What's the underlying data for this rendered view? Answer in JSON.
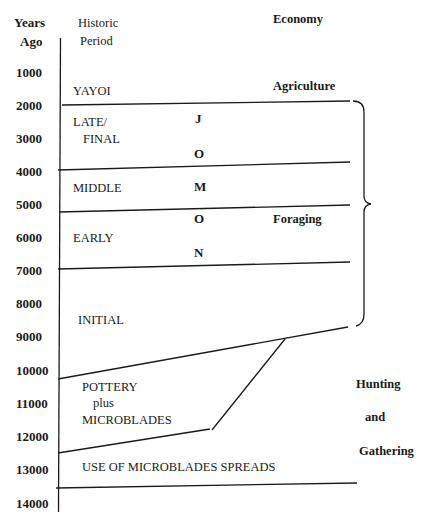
{
  "headers": {
    "years_ago_line1": "Years",
    "years_ago_line2": "Ago",
    "historic_line1": "Historic",
    "historic_line2": "Period",
    "economy": "Economy"
  },
  "axis": {
    "ticks": [
      "1000",
      "2000",
      "3000",
      "4000",
      "5000",
      "6000",
      "7000",
      "8000",
      "9000",
      "10000",
      "11000",
      "12000",
      "13000",
      "14000"
    ]
  },
  "periods": {
    "yayoi": "YAYOI",
    "late_line1": "LATE/",
    "late_line2": "FINAL",
    "middle": "MIDDLE",
    "early": "EARLY",
    "initial": "INITIAL",
    "pottery_line1": "POTTERY",
    "pottery_line2": "plus",
    "pottery_line3": "MICROBLADES",
    "microblades_spread": "USE OF MICROBLADES SPREADS"
  },
  "jomon_letters": [
    "J",
    "O",
    "M",
    "O",
    "N"
  ],
  "economy": {
    "agriculture": "Agriculture",
    "foraging": "Foraging",
    "hunting": "Hunting",
    "and": "and",
    "gathering": "Gathering"
  }
}
